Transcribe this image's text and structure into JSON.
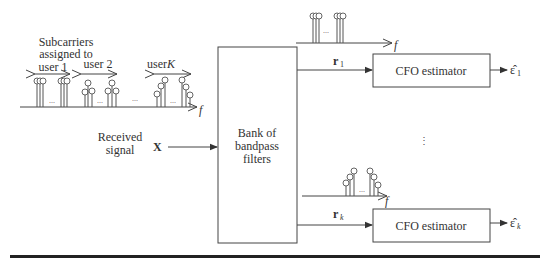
{
  "diagram": {
    "input": {
      "label_line1": "Received",
      "label_line2": "signal",
      "symbol": "X"
    },
    "spectrum_annotation": {
      "line1": "Subcarriers",
      "line2": "assigned to",
      "user1": "user 1",
      "user2": "user 2",
      "userK_prefix": "user ",
      "userK_var": "K",
      "ellipsis": "...",
      "axis_label": "f"
    },
    "filter_bank": {
      "line1": "Bank of",
      "line2": "bandpass",
      "line3": "filters"
    },
    "branches": [
      {
        "signal": "r",
        "subscript": "1",
        "block": "CFO estimator",
        "output": "ε̂",
        "output_subscript": "1",
        "spectrum_axis": "f",
        "ellipsis": "..."
      },
      {
        "signal": "r",
        "subscript": "k",
        "block": "CFO estimator",
        "output": "ε̂",
        "output_subscript": "k",
        "spectrum_axis": "f",
        "ellipsis": "..."
      }
    ],
    "vertical_ellipsis": "⋮",
    "colors": {
      "line": "#444444",
      "text": "#333333",
      "background": "#ffffff"
    }
  }
}
